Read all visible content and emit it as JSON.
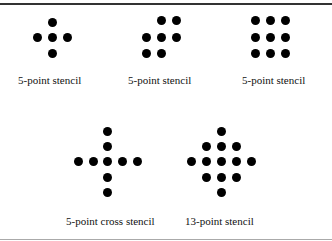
{
  "figure": {
    "stencils": [
      {
        "label": "5-point stencil",
        "label_pos": [
          18,
          80
        ],
        "dots": [
          [
            52,
            22
          ],
          [
            37,
            37
          ],
          [
            52,
            37
          ],
          [
            67,
            37
          ],
          [
            52,
            53
          ]
        ]
      },
      {
        "label": "5-point stencil",
        "label_pos": [
          128,
          80
        ],
        "dots": [
          [
            161,
            20
          ],
          [
            176,
            20
          ],
          [
            146,
            37
          ],
          [
            161,
            37
          ],
          [
            176,
            37
          ],
          [
            146,
            53
          ],
          [
            161,
            53
          ]
        ]
      },
      {
        "label": "5-point stencil",
        "label_pos": [
          242,
          80
        ],
        "dots": [
          [
            255,
            20
          ],
          [
            270,
            20
          ],
          [
            285,
            20
          ],
          [
            255,
            37
          ],
          [
            270,
            37
          ],
          [
            285,
            37
          ],
          [
            255,
            53
          ],
          [
            270,
            53
          ],
          [
            285,
            53
          ]
        ]
      },
      {
        "label": "5-point cross stencil",
        "label_pos": [
          66,
          221
        ],
        "dots": [
          [
            107,
            131
          ],
          [
            107,
            146
          ],
          [
            78,
            161
          ],
          [
            93,
            161
          ],
          [
            107,
            161
          ],
          [
            122,
            161
          ],
          [
            137,
            161
          ],
          [
            107,
            177
          ],
          [
            107,
            192
          ]
        ]
      },
      {
        "label": "13-point stencil",
        "label_pos": [
          185,
          221
        ],
        "dots": [
          [
            221,
            131
          ],
          [
            206,
            146
          ],
          [
            221,
            146
          ],
          [
            236,
            146
          ],
          [
            191,
            161
          ],
          [
            206,
            161
          ],
          [
            221,
            161
          ],
          [
            236,
            161
          ],
          [
            251,
            161
          ],
          [
            206,
            177
          ],
          [
            221,
            177
          ],
          [
            236,
            177
          ],
          [
            221,
            192
          ]
        ]
      }
    ]
  }
}
